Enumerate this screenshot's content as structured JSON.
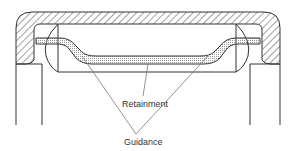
{
  "diagram": {
    "type": "bearing-cage-cross-section",
    "labels": {
      "retainment": "Retainment",
      "guidance": "Guidance"
    },
    "colors": {
      "line": "#333333",
      "hatch": "#444444",
      "leader": "#777777",
      "stipple": "#999999",
      "background": "#ffffff"
    }
  }
}
